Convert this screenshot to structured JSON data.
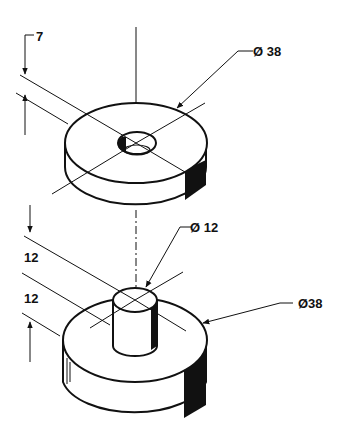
{
  "drawing": {
    "title": "Isometric dimensioned drawing: washer and stepped pin",
    "upper_part": {
      "name": "washer",
      "thickness_label": "7",
      "outer_diameter_label": "Ø 38"
    },
    "lower_part": {
      "name": "stepped pin",
      "pin_diameter_label": "Ø 12",
      "pin_height_label": "12",
      "base_height_label": "12",
      "base_diameter_label": "Ø38"
    },
    "colors": {
      "line": "#111111",
      "background": "#ffffff"
    }
  }
}
